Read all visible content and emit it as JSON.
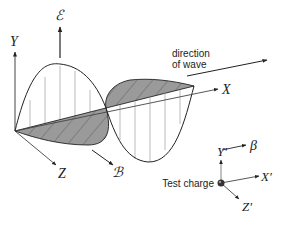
{
  "diagram": {
    "labels": {
      "y_axis": "Y",
      "x_axis": "X",
      "z_axis": "Z",
      "electric_field": "ℰ",
      "magnetic_field": "ℬ",
      "direction_line1": "direction",
      "direction_line2": "of wave",
      "test_charge": "Test charge",
      "y_prime": "Y′",
      "x_prime": "X′",
      "z_prime": "Z′",
      "beta": "β"
    },
    "colors": {
      "line": "#222222",
      "hatch_fill": "#9a9a9a",
      "field_lines": "#aaaaaa",
      "charge": "#333333"
    }
  }
}
